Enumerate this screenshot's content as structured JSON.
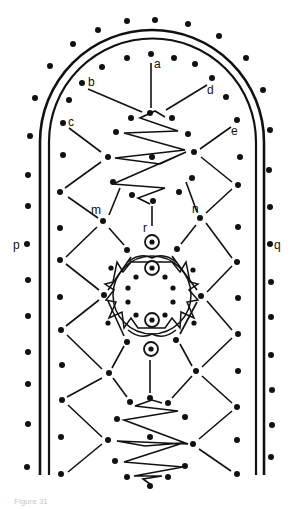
{
  "figure": {
    "caption": "Figure 31",
    "labels": [
      {
        "id": "a",
        "text": "a",
        "x": 156,
        "y": 68
      },
      {
        "id": "b",
        "text": "b",
        "x": 90,
        "y": 86
      },
      {
        "id": "c",
        "text": "c",
        "x": 69,
        "y": 126
      },
      {
        "id": "d",
        "text": "d",
        "x": 208,
        "y": 94
      },
      {
        "id": "e",
        "text": "e",
        "x": 232,
        "y": 135
      },
      {
        "id": "m",
        "text": "m",
        "x": 92,
        "y": 214
      },
      {
        "id": "n",
        "text": "n",
        "x": 193,
        "y": 213
      },
      {
        "id": "p",
        "text": "p",
        "x": 12,
        "y": 248
      },
      {
        "id": "q",
        "text": "q",
        "x": 275,
        "y": 248
      },
      {
        "id": "r",
        "text": "r",
        "x": 143,
        "y": 232
      }
    ],
    "colors": {
      "ink": "#111111",
      "paper": "#ffffff"
    }
  }
}
